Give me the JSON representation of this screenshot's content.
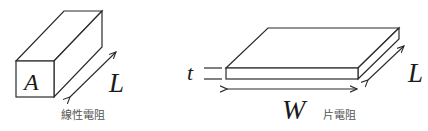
{
  "figure": {
    "line_resistor": {
      "cross_section_label": "A",
      "length_label": "L",
      "caption": "線性電阻"
    },
    "sheet_resistor": {
      "thickness_label": "t",
      "width_label": "W",
      "length_label": "L",
      "caption": "片電阻"
    }
  },
  "colors": {
    "line": "#2a2a2a",
    "caption": "#555555",
    "background": "#ffffff"
  }
}
